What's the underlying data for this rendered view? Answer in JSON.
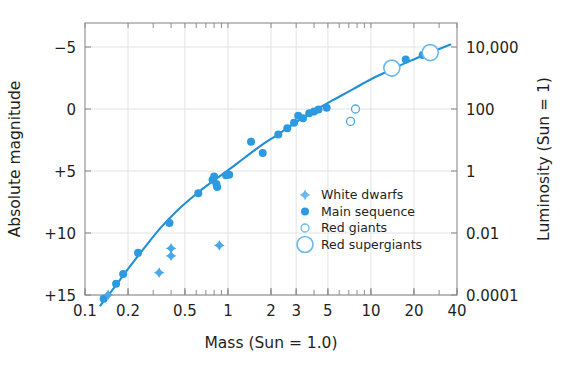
{
  "chart_data": {
    "type": "scatter",
    "title": "",
    "xlabel": "Mass (Sun = 1.0)",
    "ylabel": "Absolute magnitude",
    "y2label": "Luminosity (Sun = 1)",
    "xscale": "log",
    "xlim": [
      0.1,
      40
    ],
    "ylim": [
      15,
      -7.2
    ],
    "y2scale": "log",
    "y2lim": [
      0.0001,
      100000
    ],
    "grid": true,
    "legend_position": "lower-right-inside",
    "xticks": [
      {
        "value": 0.1,
        "label": "0.1"
      },
      {
        "value": 0.2,
        "label": "0.2"
      },
      {
        "value": 0.5,
        "label": "0.5"
      },
      {
        "value": 1,
        "label": "1"
      },
      {
        "value": 2,
        "label": "2"
      },
      {
        "value": 3,
        "label": "3"
      },
      {
        "value": 5,
        "label": "5"
      },
      {
        "value": 10,
        "label": "10"
      },
      {
        "value": 20,
        "label": "20"
      },
      {
        "value": 40,
        "label": "40"
      }
    ],
    "yticks": [
      {
        "value": -5,
        "label": "−5"
      },
      {
        "value": 0,
        "label": "0"
      },
      {
        "value": 5,
        "label": "+5"
      },
      {
        "value": 10,
        "label": "+10"
      },
      {
        "value": 15,
        "label": "+15"
      }
    ],
    "y2ticks": [
      {
        "mag": -5,
        "label": "10,000"
      },
      {
        "mag": 0,
        "label": "100"
      },
      {
        "mag": 5,
        "label": "1"
      },
      {
        "mag": 10,
        "label": "0.01"
      },
      {
        "mag": 15,
        "label": "0.0001"
      }
    ],
    "legend": [
      {
        "key": "white-dwarfs",
        "label": "White dwarfs",
        "marker": "star"
      },
      {
        "key": "main-sequence",
        "label": "Main sequence",
        "marker": "filled-circle"
      },
      {
        "key": "red-giants",
        "label": "Red giants",
        "marker": "open-circle-small"
      },
      {
        "key": "red-supergiants",
        "label": "Red supergiants",
        "marker": "open-circle-large"
      }
    ],
    "series": [
      {
        "name": "Main sequence",
        "marker": "filled-circle",
        "color": "#2b9ae0",
        "points": [
          {
            "mass": 0.135,
            "mag": 15.3
          },
          {
            "mass": 0.165,
            "mag": 14.1
          },
          {
            "mass": 0.185,
            "mag": 13.3
          },
          {
            "mass": 0.235,
            "mag": 11.6
          },
          {
            "mass": 0.39,
            "mag": 9.2
          },
          {
            "mass": 0.62,
            "mag": 6.8
          },
          {
            "mass": 0.78,
            "mag": 5.7
          },
          {
            "mass": 0.8,
            "mag": 5.45
          },
          {
            "mass": 0.83,
            "mag": 6.05
          },
          {
            "mass": 0.84,
            "mag": 6.3
          },
          {
            "mass": 0.97,
            "mag": 5.35
          },
          {
            "mass": 1.02,
            "mag": 5.3
          },
          {
            "mass": 1.45,
            "mag": 2.65
          },
          {
            "mass": 1.75,
            "mag": 3.55
          },
          {
            "mass": 2.25,
            "mag": 2.05
          },
          {
            "mass": 2.6,
            "mag": 1.55
          },
          {
            "mass": 2.9,
            "mag": 1.1
          },
          {
            "mass": 3.1,
            "mag": 0.55
          },
          {
            "mass": 3.35,
            "mag": 0.75
          },
          {
            "mass": 3.7,
            "mag": 0.35
          },
          {
            "mass": 4.0,
            "mag": 0.2
          },
          {
            "mass": 4.3,
            "mag": 0.05
          },
          {
            "mass": 4.9,
            "mag": -0.1
          },
          {
            "mass": 17.5,
            "mag": -4.0
          },
          {
            "mass": 23.0,
            "mag": -4.35
          }
        ]
      },
      {
        "name": "White dwarfs",
        "marker": "star",
        "color": "#4aa8e8",
        "points": [
          {
            "mass": 0.145,
            "mag": 15.0
          },
          {
            "mass": 0.4,
            "mag": 11.25
          },
          {
            "mass": 0.4,
            "mag": 11.85
          },
          {
            "mass": 0.33,
            "mag": 13.2
          },
          {
            "mass": 0.87,
            "mag": 11.0
          }
        ]
      },
      {
        "name": "Red giants",
        "marker": "open-circle-small",
        "color": "#4aa8e8",
        "points": [
          {
            "mass": 7.2,
            "mag": 1.0
          },
          {
            "mass": 7.8,
            "mag": 0.0
          }
        ]
      },
      {
        "name": "Red supergiants",
        "marker": "open-circle-large",
        "color": "#6ab8ec",
        "points": [
          {
            "mass": 14.0,
            "mag": -3.3
          },
          {
            "mass": 26.0,
            "mag": -4.55
          }
        ]
      }
    ],
    "fit_curve": {
      "name": "mass-luminosity relation",
      "color": "#1f8fd6",
      "points": [
        {
          "mass": 0.128,
          "mag": 15.85
        },
        {
          "mass": 0.16,
          "mag": 14.4
        },
        {
          "mass": 0.2,
          "mag": 12.9
        },
        {
          "mass": 0.26,
          "mag": 11.2
        },
        {
          "mass": 0.34,
          "mag": 9.55
        },
        {
          "mass": 0.45,
          "mag": 8.1
        },
        {
          "mass": 0.6,
          "mag": 6.85
        },
        {
          "mass": 0.8,
          "mag": 5.75
        },
        {
          "mass": 1.0,
          "mag": 4.95
        },
        {
          "mass": 1.3,
          "mag": 3.95
        },
        {
          "mass": 1.7,
          "mag": 2.95
        },
        {
          "mass": 2.2,
          "mag": 2.1
        },
        {
          "mass": 3.0,
          "mag": 1.05
        },
        {
          "mass": 4.0,
          "mag": 0.15
        },
        {
          "mass": 5.5,
          "mag": -0.75
        },
        {
          "mass": 7.5,
          "mag": -1.6
        },
        {
          "mass": 10.0,
          "mag": -2.4
        },
        {
          "mass": 14.0,
          "mag": -3.2
        },
        {
          "mass": 19.0,
          "mag": -3.9
        },
        {
          "mass": 26.0,
          "mag": -4.55
        },
        {
          "mass": 36.0,
          "mag": -5.2
        }
      ]
    },
    "colors": {
      "curve": "#1f8fd6",
      "marker_fill": "#2b9ae0",
      "marker_open": "#6ab8ec",
      "axis": "#8c8c8c",
      "grid": "#e3e3e3",
      "text": "#231f20",
      "background": "#ffffff"
    }
  }
}
